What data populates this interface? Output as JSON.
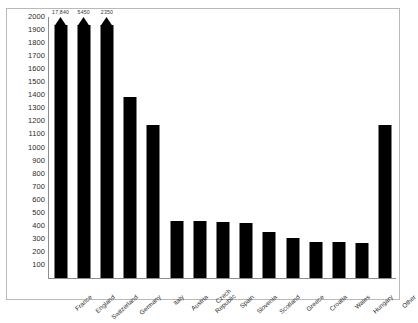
{
  "chart_data": {
    "type": "bar",
    "title": "",
    "subtitle": "",
    "xlabel": "",
    "ylabel": "",
    "ylim": [
      0,
      2000
    ],
    "ytick_step": 100,
    "grid": false,
    "legend": null,
    "bar_color": "#000000",
    "axis_color": "#8d8d8d",
    "background": "#ffffff",
    "note": "Three leftmost bars are truncated at the top of the axis and drawn with arrow tips; their true values are shown as labels above the bars.",
    "yticks": [
      2000,
      1900,
      1800,
      1700,
      1600,
      1500,
      1400,
      1300,
      1200,
      1100,
      1000,
      900,
      800,
      700,
      600,
      500,
      400,
      300,
      200,
      100
    ],
    "categories": [
      "France",
      "England",
      "Switzerland",
      "Germany",
      "Italy",
      "Austria",
      "Czech\nRepublic",
      "Spain",
      "Slovenia",
      "Scotland",
      "Greece",
      "Croatia",
      "Wales",
      "Hungary",
      "Other"
    ],
    "values": [
      17840,
      5450,
      2350,
      1390,
      1175,
      440,
      440,
      430,
      425,
      355,
      310,
      275,
      275,
      265,
      1175
    ],
    "truncated": [
      true,
      true,
      true,
      false,
      false,
      false,
      false,
      false,
      false,
      false,
      false,
      false,
      false,
      false,
      false
    ],
    "value_labels": [
      "17,840",
      "5450",
      "2350",
      "",
      "",
      "",
      "",
      "",
      "",
      "",
      "",
      "",
      "",
      "",
      ""
    ]
  }
}
